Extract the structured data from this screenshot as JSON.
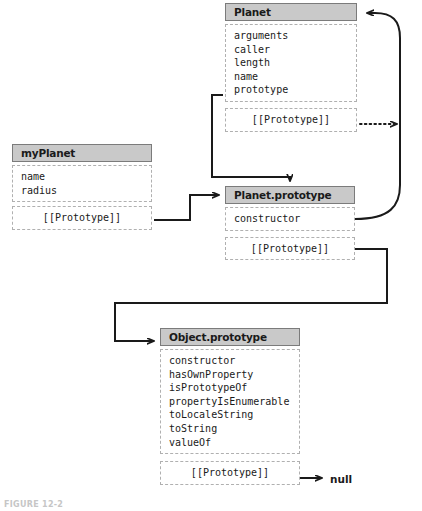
{
  "diagram": {
    "caption": "FIGURE 12-2",
    "colors": {
      "title_fill": "#c9c9c9",
      "title_border": "#7b7b7b",
      "dashed_border": "#b0b0b0",
      "line": "#1a1a1a",
      "text": "#1a1a1a"
    },
    "terminal_label": "null",
    "boxes": [
      {
        "id": "planet",
        "title": "Planet",
        "properties": [
          "arguments",
          "caller",
          "length",
          "name",
          "prototype"
        ],
        "prototype_slot": "[[Prototype]]"
      },
      {
        "id": "myplanet",
        "title": "myPlanet",
        "properties": [
          "name",
          "radius"
        ],
        "prototype_slot": "[[Prototype]]"
      },
      {
        "id": "planetprototype",
        "title": "Planet.prototype",
        "properties": [
          "constructor"
        ],
        "prototype_slot": "[[Prototype]]"
      },
      {
        "id": "objectprototype",
        "title": "Object.prototype",
        "properties": [
          "constructor",
          "hasOwnProperty",
          "isPrototypeOf",
          "propertyIsEnumerable",
          "toLocaleString",
          "toString",
          "valueOf"
        ],
        "prototype_slot": "[[Prototype]]"
      }
    ],
    "connections": [
      {
        "id": "planet-prototype-to-planetprototype",
        "from": "Planet.prototype (property)",
        "to": "Planet.prototype (object)",
        "style": "solid"
      },
      {
        "id": "planet-proto-slot-dotted",
        "from": "Planet.[[Prototype]]",
        "to": "off-diagram",
        "style": "dotted"
      },
      {
        "id": "myplanet-proto-to-planetprototype",
        "from": "myPlanet.[[Prototype]]",
        "to": "Planet.prototype",
        "style": "solid"
      },
      {
        "id": "constructor-to-planet",
        "from": "Planet.prototype.constructor",
        "to": "Planet",
        "style": "solid-curve"
      },
      {
        "id": "planetprototype-proto-to-objectprototype",
        "from": "Planet.prototype.[[Prototype]]",
        "to": "Object.prototype",
        "style": "solid"
      },
      {
        "id": "objectprototype-proto-to-null",
        "from": "Object.prototype.[[Prototype]]",
        "to": "null",
        "style": "solid"
      }
    ]
  }
}
